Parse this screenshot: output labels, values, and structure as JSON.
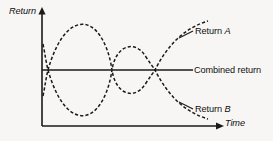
{
  "figure": {
    "background_color": "#f7f6f4",
    "ink_color": "#1a1a1a"
  },
  "axes": {
    "y_label": "Return",
    "x_label": "Time",
    "y_label_style": "italic",
    "x_label_style": "italic",
    "origin_x": 42,
    "origin_y": 126,
    "y_axis_top": 10,
    "x_axis_right": 224
  },
  "legend": {
    "return_a": "Return A",
    "return_a_italic_part": "A",
    "combined": "Combined return",
    "return_b": "Return B",
    "return_b_italic_part": "B"
  },
  "chart_data": {
    "type": "line",
    "title": "",
    "subtitle": "",
    "xlabel": "Time",
    "ylabel": "Return",
    "grid": false,
    "legend_position": "right-inline-annotations",
    "axis_style": "arrow-headed, no tick marks, no numeric scale",
    "xlim": [
      0,
      1
    ],
    "ylim": [
      0,
      1
    ],
    "annotations": [
      {
        "text": "Return A",
        "target": "series-a",
        "leader": true
      },
      {
        "text": "Combined return",
        "target": "series-combined",
        "leader": true
      },
      {
        "text": "Return B",
        "target": "series-b",
        "leader": true
      }
    ],
    "series": [
      {
        "name": "Return A",
        "style": "dashed",
        "crossings_with_combined": 3,
        "points": [
          {
            "x": 0.0,
            "y": 0.36
          },
          {
            "x": 0.03,
            "y": 0.44
          },
          {
            "x": 0.05,
            "y": 0.5
          },
          {
            "x": 0.12,
            "y": 0.72
          },
          {
            "x": 0.22,
            "y": 0.87
          },
          {
            "x": 0.33,
            "y": 0.93
          },
          {
            "x": 0.44,
            "y": 0.87
          },
          {
            "x": 0.54,
            "y": 0.66
          },
          {
            "x": 0.6,
            "y": 0.5
          },
          {
            "x": 0.66,
            "y": 0.66
          },
          {
            "x": 0.72,
            "y": 0.73
          },
          {
            "x": 0.8,
            "y": 0.66
          },
          {
            "x": 0.86,
            "y": 0.5
          },
          {
            "x": 0.92,
            "y": 0.62
          },
          {
            "x": 0.97,
            "y": 0.76
          },
          {
            "x": 1.0,
            "y": 0.88
          }
        ]
      },
      {
        "name": "Return B",
        "style": "dashed",
        "crossings_with_combined": 3,
        "points": [
          {
            "x": 0.0,
            "y": 0.64
          },
          {
            "x": 0.03,
            "y": 0.56
          },
          {
            "x": 0.05,
            "y": 0.5
          },
          {
            "x": 0.12,
            "y": 0.28
          },
          {
            "x": 0.22,
            "y": 0.13
          },
          {
            "x": 0.33,
            "y": 0.07
          },
          {
            "x": 0.44,
            "y": 0.13
          },
          {
            "x": 0.54,
            "y": 0.34
          },
          {
            "x": 0.6,
            "y": 0.5
          },
          {
            "x": 0.66,
            "y": 0.34
          },
          {
            "x": 0.72,
            "y": 0.27
          },
          {
            "x": 0.8,
            "y": 0.34
          },
          {
            "x": 0.86,
            "y": 0.5
          },
          {
            "x": 0.92,
            "y": 0.38
          },
          {
            "x": 0.97,
            "y": 0.24
          },
          {
            "x": 1.0,
            "y": 0.12
          }
        ]
      },
      {
        "name": "Combined return",
        "style": "solid",
        "constant_value": 0.5,
        "points": [
          {
            "x": 0.0,
            "y": 0.5
          },
          {
            "x": 1.0,
            "y": 0.5
          }
        ]
      }
    ]
  }
}
